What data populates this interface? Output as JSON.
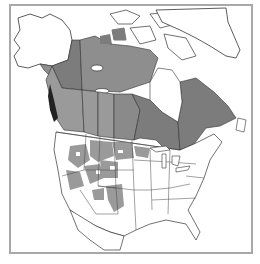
{
  "map": {
    "type": "range-map",
    "region": "North America",
    "legend": [],
    "labels": [],
    "colors": {
      "background": "#ffffff",
      "frame": "#a8a8a8",
      "outline": "#333333",
      "range_dark": "#7c7c7c",
      "range_medium": "#8e8e8e",
      "range_light": "#9a9a9a",
      "land": "#ffffff"
    },
    "shaded_regions": [
      "Yukon",
      "Northwest Territories (southern)",
      "Nunavut (southern mainland)",
      "British Columbia",
      "Alberta",
      "Saskatchewan",
      "Manitoba",
      "Ontario",
      "Quebec",
      "Labrador",
      "Western US (patchy: WA, OR, ID, MT, WY, ND, SD, NV, UT, CO, NE)",
      "Northern Great Lakes (MN, WI, MI north)",
      "New England / Maritimes (partial)"
    ]
  }
}
